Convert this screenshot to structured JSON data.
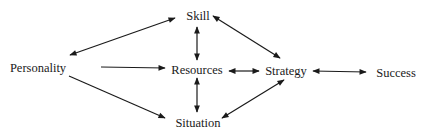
{
  "diagram": {
    "nodes": [
      {
        "id": "personality",
        "label": "Personality",
        "x": 38,
        "y": 68
      },
      {
        "id": "skill",
        "label": "Skill",
        "x": 198,
        "y": 16
      },
      {
        "id": "resources",
        "label": "Resources",
        "x": 197,
        "y": 70
      },
      {
        "id": "situation",
        "label": "Situation",
        "x": 198,
        "y": 123
      },
      {
        "id": "strategy",
        "label": "Strategy",
        "x": 286,
        "y": 71
      },
      {
        "id": "success",
        "label": "Success",
        "x": 396,
        "y": 73
      }
    ],
    "edges": [
      {
        "from": "personality",
        "to": "skill",
        "direction": "both"
      },
      {
        "from": "personality",
        "to": "resources",
        "direction": "forward"
      },
      {
        "from": "personality",
        "to": "situation",
        "direction": "forward"
      },
      {
        "from": "skill",
        "to": "resources",
        "direction": "both"
      },
      {
        "from": "resources",
        "to": "situation",
        "direction": "both"
      },
      {
        "from": "skill",
        "to": "strategy",
        "direction": "both"
      },
      {
        "from": "resources",
        "to": "strategy",
        "direction": "both"
      },
      {
        "from": "situation",
        "to": "strategy",
        "direction": "both"
      },
      {
        "from": "strategy",
        "to": "success",
        "direction": "both"
      }
    ],
    "colors": {
      "line": "#1a1a1a",
      "text": "#1a1a1a",
      "background": "#ffffff"
    }
  }
}
